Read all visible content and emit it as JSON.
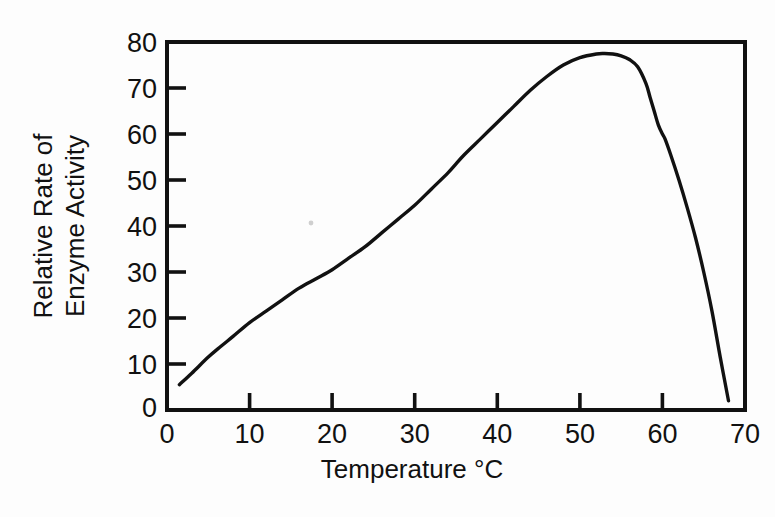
{
  "chart_data": {
    "type": "line",
    "title": "",
    "subtitle": "",
    "xlabel": "Temperature °C",
    "ylabel_line1": "Relative Rate of",
    "ylabel_line2": "Enzyme Activity",
    "ylabel": "Relative Rate of Enzyme Activity",
    "xlim": [
      0,
      70
    ],
    "ylim": [
      0,
      80
    ],
    "xticks": [
      0,
      10,
      20,
      30,
      40,
      50,
      60,
      70
    ],
    "yticks": [
      0,
      10,
      20,
      30,
      40,
      50,
      60,
      70,
      80
    ],
    "xtick_labels": [
      "0",
      "10",
      "20",
      "30",
      "40",
      "50",
      "60",
      "70"
    ],
    "ytick_labels": [
      "0",
      "10",
      "20",
      "30",
      "40",
      "50",
      "60",
      "70",
      "80"
    ],
    "grid": false,
    "legend": null,
    "legend_position": "none",
    "tick_direction": "in",
    "frame": "full-box",
    "line_color": "#111111",
    "background_color": "#ffffff",
    "series": [
      {
        "name": "Relative Rate of Enzyme Activity",
        "x": [
          1.5,
          3,
          5,
          6.5,
          8,
          10,
          12,
          14,
          16,
          18,
          20,
          22,
          24,
          26,
          28,
          30,
          32,
          34,
          35,
          36,
          38,
          40,
          42,
          44,
          46,
          48,
          50,
          52,
          53,
          54,
          55,
          56,
          57,
          58,
          58.5,
          59,
          59.5,
          60,
          60.3,
          61,
          62,
          63,
          64,
          65,
          66,
          67,
          68
        ],
        "y": [
          5.5,
          8,
          11.5,
          13.8,
          16,
          19,
          21.5,
          24,
          26.5,
          28.5,
          30.5,
          33,
          35.5,
          38.5,
          41.5,
          44.5,
          48,
          51.5,
          53.5,
          55.5,
          59,
          62.5,
          66,
          69.5,
          72.5,
          75,
          76.6,
          77.4,
          77.5,
          77.4,
          77,
          76.2,
          74.6,
          71,
          68,
          65,
          62,
          60,
          59,
          55.5,
          50,
          44,
          37.5,
          30,
          21.5,
          11.5,
          2
        ]
      }
    ]
  },
  "annotations": {
    "speck": "faint-gray-speck-artifact"
  }
}
